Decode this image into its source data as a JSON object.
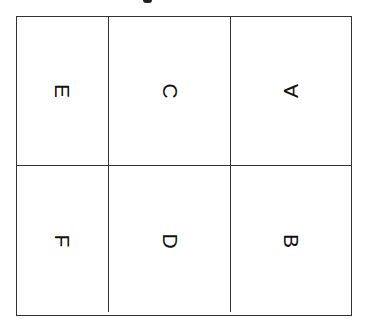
{
  "diagram": {
    "title_fragment": "",
    "layout": "2 rows x 3 columns grid",
    "line_color": "#333333",
    "cells": [
      {
        "row": 0,
        "col": 0,
        "label": "E"
      },
      {
        "row": 0,
        "col": 1,
        "label": "C"
      },
      {
        "row": 0,
        "col": 2,
        "label": "A"
      },
      {
        "row": 1,
        "col": 0,
        "label": "F"
      },
      {
        "row": 1,
        "col": 1,
        "label": "D"
      },
      {
        "row": 1,
        "col": 2,
        "label": "B"
      }
    ]
  }
}
